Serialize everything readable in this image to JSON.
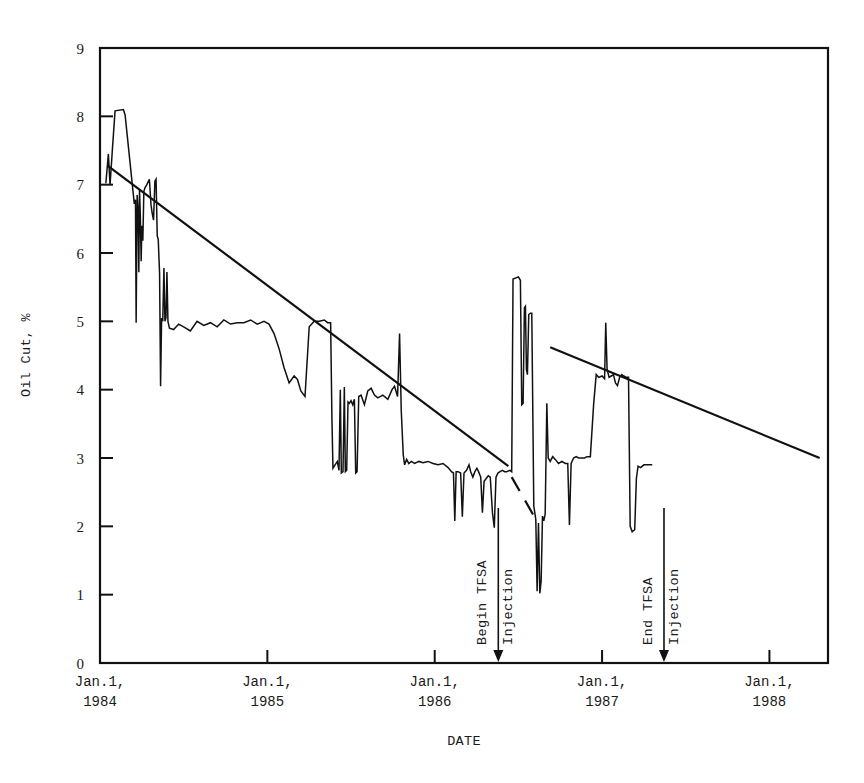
{
  "chart_data": {
    "type": "line",
    "title": "",
    "xlabel": "DATE",
    "ylabel": "Oil Cut, %",
    "ylim": [
      0,
      9
    ],
    "ytick_labels": [
      "0",
      "1",
      "2",
      "3",
      "4",
      "5",
      "6",
      "7",
      "8",
      "9"
    ],
    "ytick_values": [
      0,
      1,
      2,
      3,
      4,
      5,
      6,
      7,
      8,
      9
    ],
    "xtick_labels": [
      {
        "line1": "Jan.1,",
        "line2": "1984"
      },
      {
        "line1": "Jan.1,",
        "line2": "1985"
      },
      {
        "line1": "Jan.1,",
        "line2": "1986"
      },
      {
        "line1": "Jan.1,",
        "line2": "1987"
      },
      {
        "line1": "Jan.1,",
        "line2": "1988"
      }
    ],
    "xtick_values": [
      1984.0,
      1985.0,
      1986.0,
      1987.0,
      1988.0
    ],
    "xlim": [
      1984.0,
      1988.35
    ],
    "grid": false,
    "legend": "none",
    "annotations": [
      {
        "name": "begin-tfsa-injection",
        "line1": "Begin TFSA",
        "line2": "Injection",
        "x": 1986.38,
        "marker": "down-arrow-to-axis"
      },
      {
        "name": "end-tfsa-injection",
        "line1": "End TFSA",
        "line2": "Injection",
        "x": 1987.37,
        "marker": "down-arrow-to-axis"
      }
    ],
    "series": [
      {
        "name": "Oil Cut",
        "style": "solid-line",
        "points": [
          [
            1984.035,
            7.02
          ],
          [
            1984.05,
            7.45
          ],
          [
            1984.06,
            7.0
          ],
          [
            1984.075,
            7.55
          ],
          [
            1984.09,
            8.08
          ],
          [
            1984.14,
            8.1
          ],
          [
            1984.15,
            8.02
          ],
          [
            1984.205,
            6.72
          ],
          [
            1984.212,
            6.78
          ],
          [
            1984.216,
            4.98
          ],
          [
            1984.222,
            6.85
          ],
          [
            1984.228,
            6.6
          ],
          [
            1984.232,
            5.72
          ],
          [
            1984.236,
            6.92
          ],
          [
            1984.241,
            6.55
          ],
          [
            1984.246,
            5.88
          ],
          [
            1984.25,
            6.4
          ],
          [
            1984.256,
            6.18
          ],
          [
            1984.262,
            6.9
          ],
          [
            1984.268,
            6.95
          ],
          [
            1984.28,
            7.0
          ],
          [
            1984.295,
            7.08
          ],
          [
            1984.305,
            6.7
          ],
          [
            1984.312,
            6.58
          ],
          [
            1984.32,
            6.48
          ],
          [
            1984.328,
            7.05
          ],
          [
            1984.335,
            7.08
          ],
          [
            1984.342,
            6.25
          ],
          [
            1984.348,
            6.2
          ],
          [
            1984.356,
            5.7
          ],
          [
            1984.362,
            4.05
          ],
          [
            1984.368,
            5.05
          ],
          [
            1984.375,
            5.0
          ],
          [
            1984.382,
            5.78
          ],
          [
            1984.388,
            5.0
          ],
          [
            1984.394,
            5.05
          ],
          [
            1984.4,
            5.72
          ],
          [
            1984.406,
            5.0
          ],
          [
            1984.415,
            4.9
          ],
          [
            1984.44,
            4.88
          ],
          [
            1984.47,
            4.96
          ],
          [
            1984.5,
            4.92
          ],
          [
            1984.54,
            4.86
          ],
          [
            1984.58,
            5.0
          ],
          [
            1984.62,
            4.94
          ],
          [
            1984.66,
            4.98
          ],
          [
            1984.7,
            4.92
          ],
          [
            1984.74,
            5.02
          ],
          [
            1984.78,
            4.96
          ],
          [
            1984.82,
            4.98
          ],
          [
            1984.86,
            4.98
          ],
          [
            1984.9,
            5.02
          ],
          [
            1984.94,
            4.96
          ],
          [
            1984.98,
            5.0
          ],
          [
            1985.01,
            4.96
          ],
          [
            1985.04,
            4.82
          ],
          [
            1985.07,
            4.6
          ],
          [
            1985.1,
            4.32
          ],
          [
            1985.13,
            4.1
          ],
          [
            1985.16,
            4.2
          ],
          [
            1985.18,
            4.15
          ],
          [
            1985.2,
            3.98
          ],
          [
            1985.225,
            3.9
          ],
          [
            1985.25,
            4.92
          ],
          [
            1985.28,
            5.0
          ],
          [
            1985.31,
            5.0
          ],
          [
            1985.34,
            5.02
          ],
          [
            1985.36,
            4.98
          ],
          [
            1985.378,
            4.98
          ],
          [
            1985.386,
            3.55
          ],
          [
            1985.392,
            2.85
          ],
          [
            1985.4,
            2.88
          ],
          [
            1985.418,
            2.95
          ],
          [
            1985.428,
            2.82
          ],
          [
            1985.436,
            4.0
          ],
          [
            1985.442,
            2.78
          ],
          [
            1985.452,
            2.8
          ],
          [
            1985.46,
            4.04
          ],
          [
            1985.466,
            2.8
          ],
          [
            1985.474,
            2.82
          ],
          [
            1985.482,
            3.82
          ],
          [
            1985.49,
            3.8
          ],
          [
            1985.5,
            3.84
          ],
          [
            1985.51,
            3.78
          ],
          [
            1985.52,
            3.86
          ],
          [
            1985.528,
            2.78
          ],
          [
            1985.536,
            2.8
          ],
          [
            1985.546,
            3.9
          ],
          [
            1985.56,
            3.92
          ],
          [
            1985.58,
            3.78
          ],
          [
            1985.6,
            3.98
          ],
          [
            1985.62,
            4.02
          ],
          [
            1985.64,
            3.92
          ],
          [
            1985.66,
            3.88
          ],
          [
            1985.69,
            3.92
          ],
          [
            1985.72,
            3.86
          ],
          [
            1985.745,
            4.0
          ],
          [
            1985.76,
            4.05
          ],
          [
            1985.778,
            3.9
          ],
          [
            1985.79,
            4.82
          ],
          [
            1985.8,
            3.7
          ],
          [
            1985.812,
            3.05
          ],
          [
            1985.82,
            2.9
          ],
          [
            1985.832,
            2.98
          ],
          [
            1985.845,
            2.92
          ],
          [
            1985.86,
            2.95
          ],
          [
            1985.88,
            2.92
          ],
          [
            1985.905,
            2.95
          ],
          [
            1985.93,
            2.93
          ],
          [
            1985.96,
            2.95
          ],
          [
            1985.99,
            2.92
          ],
          [
            1986.02,
            2.9
          ],
          [
            1986.05,
            2.92
          ],
          [
            1986.08,
            2.86
          ],
          [
            1986.1,
            2.8
          ],
          [
            1986.112,
            2.78
          ],
          [
            1986.12,
            2.08
          ],
          [
            1986.128,
            2.8
          ],
          [
            1986.14,
            2.8
          ],
          [
            1986.155,
            2.78
          ],
          [
            1986.165,
            2.14
          ],
          [
            1986.175,
            2.78
          ],
          [
            1986.19,
            2.82
          ],
          [
            1986.205,
            2.9
          ],
          [
            1986.215,
            2.8
          ],
          [
            1986.228,
            2.72
          ],
          [
            1986.24,
            2.8
          ],
          [
            1986.252,
            2.85
          ],
          [
            1986.262,
            2.8
          ],
          [
            1986.275,
            2.72
          ],
          [
            1986.285,
            2.2
          ],
          [
            1986.295,
            2.66
          ],
          [
            1986.308,
            2.7
          ],
          [
            1986.32,
            2.74
          ],
          [
            1986.332,
            2.72
          ],
          [
            1986.345,
            2.2
          ],
          [
            1986.356,
            1.98
          ],
          [
            1986.366,
            2.72
          ],
          [
            1986.378,
            2.78
          ],
          [
            1986.39,
            2.8
          ],
          [
            1986.405,
            2.82
          ],
          [
            1986.418,
            2.8
          ],
          [
            1986.43,
            2.8
          ],
          [
            1986.45,
            2.82
          ],
          [
            1986.46,
            2.8
          ],
          [
            1986.468,
            5.62
          ],
          [
            1986.5,
            5.65
          ],
          [
            1986.512,
            5.6
          ],
          [
            1986.52,
            3.78
          ],
          [
            1986.528,
            3.8
          ],
          [
            1986.536,
            5.2
          ],
          [
            1986.542,
            5.22
          ],
          [
            1986.548,
            4.3
          ],
          [
            1986.554,
            4.22
          ],
          [
            1986.562,
            5.1
          ],
          [
            1986.572,
            5.12
          ],
          [
            1986.58,
            5.12
          ],
          [
            1986.592,
            2.3
          ],
          [
            1986.604,
            2.1
          ],
          [
            1986.612,
            1.05
          ],
          [
            1986.62,
            2.05
          ],
          [
            1986.628,
            1.02
          ],
          [
            1986.636,
            1.2
          ],
          [
            1986.644,
            2.15
          ],
          [
            1986.652,
            2.08
          ],
          [
            1986.66,
            2.18
          ],
          [
            1986.67,
            3.8
          ],
          [
            1986.678,
            3.0
          ],
          [
            1986.69,
            2.95
          ],
          [
            1986.705,
            3.02
          ],
          [
            1986.72,
            2.98
          ],
          [
            1986.74,
            2.92
          ],
          [
            1986.76,
            2.95
          ],
          [
            1986.78,
            2.92
          ],
          [
            1986.795,
            2.92
          ],
          [
            1986.805,
            2.02
          ],
          [
            1986.815,
            2.92
          ],
          [
            1986.83,
            3.0
          ],
          [
            1986.845,
            3.02
          ],
          [
            1986.86,
            3.0
          ],
          [
            1986.88,
            3.0
          ],
          [
            1986.895,
            3.0
          ],
          [
            1986.91,
            3.02
          ],
          [
            1986.93,
            3.02
          ],
          [
            1986.95,
            3.8
          ],
          [
            1986.965,
            4.22
          ],
          [
            1986.98,
            4.18
          ],
          [
            1987.0,
            4.2
          ],
          [
            1987.015,
            4.16
          ],
          [
            1987.022,
            4.98
          ],
          [
            1987.03,
            4.3
          ],
          [
            1987.042,
            4.18
          ],
          [
            1987.055,
            4.2
          ],
          [
            1987.068,
            4.22
          ],
          [
            1987.08,
            4.1
          ],
          [
            1987.092,
            4.06
          ],
          [
            1987.105,
            4.18
          ],
          [
            1987.118,
            4.22
          ],
          [
            1987.13,
            4.2
          ],
          [
            1987.145,
            4.18
          ],
          [
            1987.158,
            4.18
          ],
          [
            1987.168,
            2.0
          ],
          [
            1987.18,
            1.92
          ],
          [
            1987.195,
            1.95
          ],
          [
            1987.205,
            2.7
          ],
          [
            1987.215,
            2.88
          ],
          [
            1987.23,
            2.86
          ],
          [
            1987.25,
            2.9
          ],
          [
            1987.275,
            2.9
          ],
          [
            1987.3,
            2.9
          ]
        ]
      }
    ],
    "trend_lines": [
      {
        "name": "pre-injection-decline-trend",
        "style": "solid",
        "start": [
          1984.045,
          7.28
        ],
        "end": [
          1986.44,
          2.88
        ]
      },
      {
        "name": "injection-period-trend-dashed",
        "style": "dashed",
        "start": [
          1986.46,
          2.72
        ],
        "end": [
          1986.6,
          2.12
        ]
      },
      {
        "name": "post-injection-decline-trend",
        "style": "solid",
        "start": [
          1986.69,
          4.62
        ],
        "end": [
          1988.3,
          3.0
        ]
      }
    ]
  }
}
